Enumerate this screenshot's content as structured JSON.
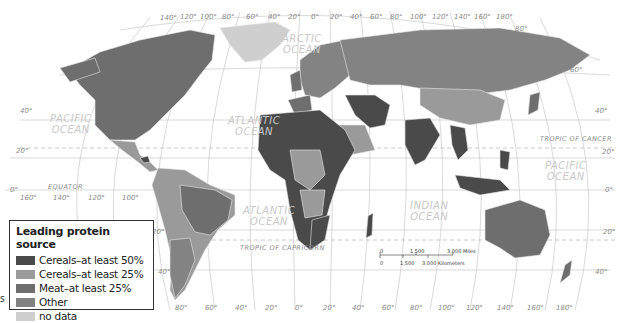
{
  "legend": {
    "title": "Leading protein source",
    "items": [
      {
        "label": "Cereals–at least 50%",
        "color": "#4a4a4a"
      },
      {
        "label": "Cereals–at least 25%",
        "color": "#9a9a9a"
      },
      {
        "label": "Meat–at least 25%",
        "color": "#6e6e6e"
      },
      {
        "label": "Other",
        "color": "#838383"
      },
      {
        "label": "no data",
        "color": "#cfcfcf"
      }
    ]
  },
  "oceans": {
    "arctic": "ARCTIC\nOCEAN",
    "pacific_west": "PACIFIC\nOCEAN",
    "atlantic_north": "ATLANTIC\nOCEAN",
    "atlantic_south": "ATLANTIC\nOCEAN",
    "indian": "INDIAN\nOCEAN",
    "pacific_east": "PACIFIC\nOCEAN"
  },
  "lines": {
    "equator": "EQUATOR",
    "tropic_cancer": "TROPIC OF CANCER",
    "tropic_capricorn": "TROPIC OF CAPRICORN"
  },
  "top_longitudes": [
    "140°",
    "120°",
    "100°",
    "80°",
    "60°",
    "40°",
    "20°",
    "0°",
    "20°",
    "40°",
    "60°",
    "80°",
    "100°",
    "120°",
    "140°",
    "160°",
    "180°"
  ],
  "bottom_longitudes": [
    "80°",
    "60°",
    "40°",
    "20°",
    "0°",
    "20°",
    "40°",
    "60°",
    "80°",
    "100°",
    "120°",
    "140°",
    "160°",
    "180°"
  ],
  "left_longitudes": [
    "160°",
    "140°",
    "120°",
    "100°"
  ],
  "left_latitudes": [
    "40°",
    "20°",
    "0°",
    "20°",
    "40°"
  ],
  "right_latitudes": [
    "80°",
    "60°",
    "40°",
    "20°",
    "0°",
    "20°",
    "40°"
  ],
  "scale": {
    "miles": [
      "0",
      "1,500",
      "3,000 Miles"
    ],
    "km": [
      "0",
      "1,500",
      "3,000 Kilometers"
    ]
  },
  "edge_text": "s"
}
